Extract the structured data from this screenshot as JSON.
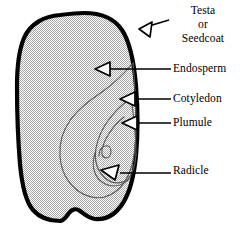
{
  "diagram": {
    "background_color": "#ffffff",
    "outline_color": "#000000",
    "fill_color": "#d6d6d6",
    "inner_line_color": "#4a4a4a",
    "labels": {
      "testa_line1": "Testa",
      "testa_line2": "or",
      "testa_line3": "Seedcoat",
      "endosperm": "Endosperm",
      "cotyledon": "Cotyledon",
      "plumule": "Plumule",
      "radicle": "Radicle"
    },
    "parts": [
      {
        "name": "testa-or-seedcoat",
        "label": "Testa or Seedcoat"
      },
      {
        "name": "endosperm",
        "label": "Endosperm"
      },
      {
        "name": "cotyledon",
        "label": "Cotyledon"
      },
      {
        "name": "plumule",
        "label": "Plumule"
      },
      {
        "name": "radicle",
        "label": "Radicle"
      }
    ]
  }
}
